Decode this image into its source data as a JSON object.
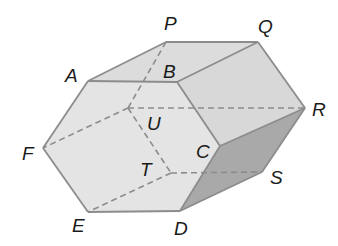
{
  "diagram": {
    "type": "hexagonal-prism",
    "colors": {
      "front_face": "#e4e4e4",
      "top_faces": "#dcdcdc",
      "side_face": "#d8d8d8",
      "shaded_face": "#a9a9a9",
      "edge": "#8c8c8c",
      "hidden_edge": "#8c8c8c",
      "label": "#1a1a1a"
    },
    "vertices": {
      "A": {
        "x": 88,
        "y": 81
      },
      "B": {
        "x": 177,
        "y": 82
      },
      "C": {
        "x": 220,
        "y": 146
      },
      "D": {
        "x": 180,
        "y": 211
      },
      "E": {
        "x": 88,
        "y": 212
      },
      "F": {
        "x": 43,
        "y": 148
      },
      "P": {
        "x": 166,
        "y": 42
      },
      "Q": {
        "x": 258,
        "y": 42
      },
      "R": {
        "x": 305,
        "y": 108
      },
      "S": {
        "x": 262,
        "y": 172
      },
      "T": {
        "x": 171,
        "y": 173
      },
      "U": {
        "x": 128,
        "y": 108
      }
    },
    "labels": [
      {
        "id": "A",
        "text": "A",
        "x": 65,
        "y": 82
      },
      {
        "id": "B",
        "text": "B",
        "x": 163,
        "y": 78
      },
      {
        "id": "C",
        "text": "C",
        "x": 196,
        "y": 158
      },
      {
        "id": "D",
        "text": "D",
        "x": 174,
        "y": 235
      },
      {
        "id": "E",
        "text": "E",
        "x": 72,
        "y": 232
      },
      {
        "id": "F",
        "text": "F",
        "x": 22,
        "y": 160
      },
      {
        "id": "P",
        "text": "P",
        "x": 164,
        "y": 30
      },
      {
        "id": "Q",
        "text": "Q",
        "x": 258,
        "y": 33
      },
      {
        "id": "R",
        "text": "R",
        "x": 312,
        "y": 116
      },
      {
        "id": "S",
        "text": "S",
        "x": 270,
        "y": 184
      },
      {
        "id": "T",
        "text": "T",
        "x": 140,
        "y": 176
      },
      {
        "id": "U",
        "text": "U",
        "x": 147,
        "y": 130
      }
    ]
  }
}
